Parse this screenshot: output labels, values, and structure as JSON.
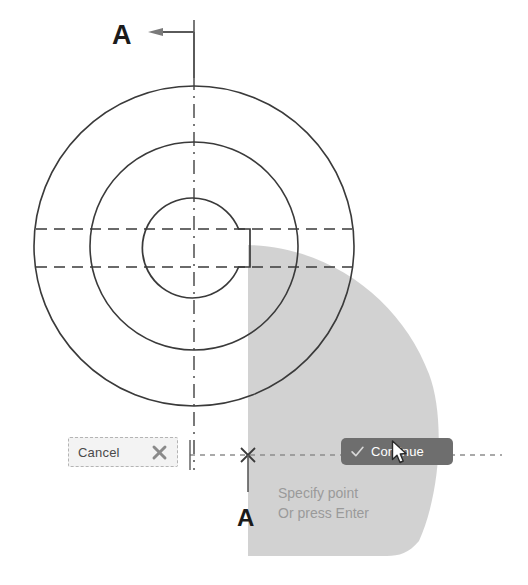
{
  "app": {
    "title": "Section View Drawing",
    "background_color": "#ffffff"
  },
  "drawing": {
    "name": "shaft-section-view",
    "line_color": "#3a3a3a",
    "centerline_color": "#4a4a4a",
    "hidden_line_color": "#3a3a3a",
    "center": {
      "x": 194,
      "y": 246
    },
    "circles": [
      {
        "name": "outer-circle",
        "radius": 160
      },
      {
        "name": "middle-circle",
        "radius": 104
      },
      {
        "name": "bore-circle",
        "radius": 50
      }
    ],
    "keyway": {
      "name": "keyway-notch",
      "top_y": 229,
      "bottom_y": 267,
      "outer_x": 250
    },
    "hidden_lines": [
      {
        "name": "keyway-projection-upper",
        "y": 229,
        "x1": 36,
        "x2": 352
      },
      {
        "name": "keyway-projection-lower",
        "y": 267,
        "x1": 36,
        "x2": 352
      }
    ],
    "vertical_centerline": {
      "name": "vertical-centerline",
      "x": 194,
      "y1": 20,
      "y2": 470
    }
  },
  "section_marks": {
    "top_letter": "A",
    "bottom_letter": "A",
    "arrow_direction": "left"
  },
  "selection": {
    "name": "highlight-region",
    "fill_color": "#cccccc",
    "opacity": 0.85,
    "left_edge_x": 248,
    "top_y": 245,
    "bottom_y": 556,
    "max_right_x": 436
  },
  "tracking": {
    "snap_marker": "x-snap-marker",
    "snap_point": {
      "x": 248,
      "y": 455
    },
    "dotted_line_color": "#8d8d8d",
    "left_extent_x": 190,
    "right_extent_x": 502
  },
  "controls": {
    "cancel": {
      "label": "Cancel",
      "icon": "close-x-icon",
      "background_color": "#f3f3f3",
      "border_color": "#b4b4b4",
      "text_color": "#4a4a4a"
    },
    "continue": {
      "label": "Continue",
      "icon": "checkmark-icon",
      "background_color": "#6e6e6e",
      "text_color": "#ffffff"
    }
  },
  "prompt": {
    "line1": "Specify point",
    "line2": "Or press Enter",
    "text_color": "#9a9a9a"
  },
  "cursor": {
    "name": "mouse-pointer",
    "x": 391,
    "y": 440
  }
}
